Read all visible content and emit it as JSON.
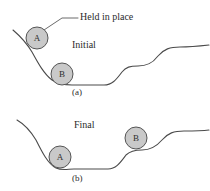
{
  "figure": {
    "annotations": {
      "held_in_place": "Held in place"
    },
    "panels": [
      {
        "id": "panel-a",
        "caption": "(a)",
        "state_label": "Initial",
        "balls": [
          {
            "label": "A",
            "cx": 37,
            "cy": 38,
            "r": 11
          },
          {
            "label": "B",
            "cx": 62,
            "cy": 74,
            "r": 11
          }
        ],
        "terrain_path": "M 13 30 C 20 36 26 42 32 52 C 38 63 44 74 52 80 C 58 84 64 85 72 85 L 104 85 C 112 85 116 80 122 72 C 126 67 130 66 138 66 C 146 66 152 64 158 56 C 164 49 170 47 180 47 C 190 47 200 46 209 45",
        "leader_line_path": "M 44 30 L 62 18 L 78 18"
      },
      {
        "id": "panel-b",
        "caption": "(b)",
        "state_label": "Final",
        "balls": [
          {
            "label": "A",
            "cx": 60,
            "cy": 157,
            "r": 11
          },
          {
            "label": "B",
            "cx": 136,
            "cy": 138,
            "r": 11
          }
        ],
        "terrain_path": "M 17 120 C 24 124 30 130 36 140 C 42 152 48 164 56 168 C 62 171 68 169 74 169 L 108 169 C 116 169 120 163 126 155 C 130 151 134 150 142 150 C 150 150 156 147 162 140 C 168 133 174 131 184 131 C 193 131 201 131 209 130"
      }
    ],
    "colors": {
      "ball_fill": "#c9c9c9",
      "ball_stroke": "#555555",
      "terrain_stroke": "#4a4a4a",
      "background": "#ffffff",
      "text": "#2b2b2b"
    }
  }
}
